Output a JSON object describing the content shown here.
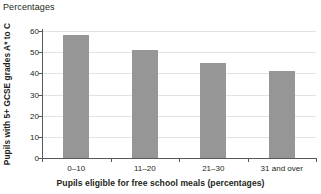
{
  "header": {
    "label": "Percentages"
  },
  "chart_data": {
    "type": "bar",
    "title": "Percentages",
    "xlabel": "Pupils eligible for free school meals (percentages)",
    "ylabel": "Pupils with 5+ GCSE grades A* to C",
    "categories": [
      "0–10",
      "11–20",
      "21–30",
      "31 and over"
    ],
    "values": [
      58,
      51,
      45,
      41
    ],
    "yticks": [
      0,
      10,
      20,
      30,
      40,
      50,
      60
    ],
    "ytick_labels": [
      "0",
      "10",
      "20",
      "30",
      "40",
      "50",
      "60"
    ],
    "ylim": [
      0,
      60
    ],
    "grid": true,
    "legend": null,
    "series": [
      {
        "name": "Pupils with 5+ GCSE grades A* to C",
        "values": [
          58,
          51,
          45,
          41
        ]
      }
    ],
    "bar_color": "#969696",
    "axis_color": "#58585a",
    "gridline_color": "#e3e3e3",
    "text_color": "#231f20"
  }
}
